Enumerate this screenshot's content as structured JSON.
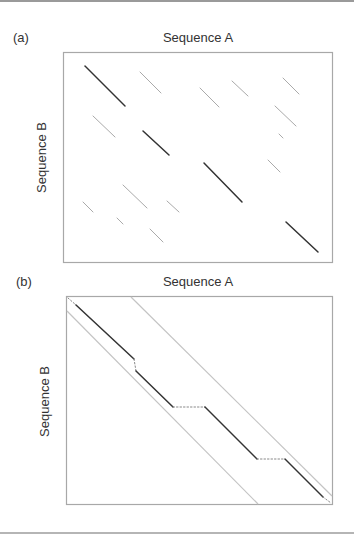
{
  "figure": {
    "panels": [
      {
        "label": "(a)",
        "title": "Sequence A",
        "ylabel": "Sequence B",
        "description": "Dot plot with scattered diagonal match segments"
      },
      {
        "label": "(b)",
        "title": "Sequence A",
        "ylabel": "Sequence B",
        "description": "Banded alignment path with gaps shown as dotted segments"
      }
    ],
    "colors": {
      "frame": "#a8a8a8",
      "strong_match": "#333333",
      "weak_match": "#b0b0b0",
      "band": "#bdbdbd",
      "gap": "#888888"
    }
  }
}
